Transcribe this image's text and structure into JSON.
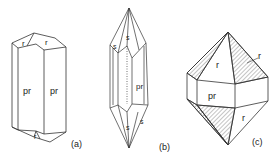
{
  "figure": {
    "crystals": [
      {
        "id": "a",
        "caption": "(a)",
        "faces": {
          "prism_left": "pr",
          "prism_right": "pr",
          "rhomb_top_left": "r",
          "rhomb_top_right": "r",
          "rhomb_bottom": "r"
        }
      },
      {
        "id": "b",
        "caption": "(b)",
        "faces": {
          "prism": "pr",
          "top_s": "s",
          "top_s_side": "s",
          "bottom_s": "s",
          "bottom_s_side": "s"
        }
      },
      {
        "id": "c",
        "caption": "(c)",
        "faces": {
          "top_r": "r",
          "top_r_pointer": "r",
          "prism": "pr",
          "bottom_r": "r"
        }
      }
    ],
    "colors": {
      "line": "#333333",
      "hatch": "#555555",
      "background": "#ffffff"
    }
  }
}
